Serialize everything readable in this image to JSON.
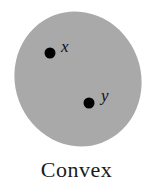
{
  "diagram": {
    "caption": "Convex",
    "shape": {
      "type": "ellipse",
      "fill": "#a8a8a8"
    },
    "points": [
      {
        "label": "x",
        "color": "#000000"
      },
      {
        "label": "y",
        "color": "#000000"
      }
    ]
  }
}
